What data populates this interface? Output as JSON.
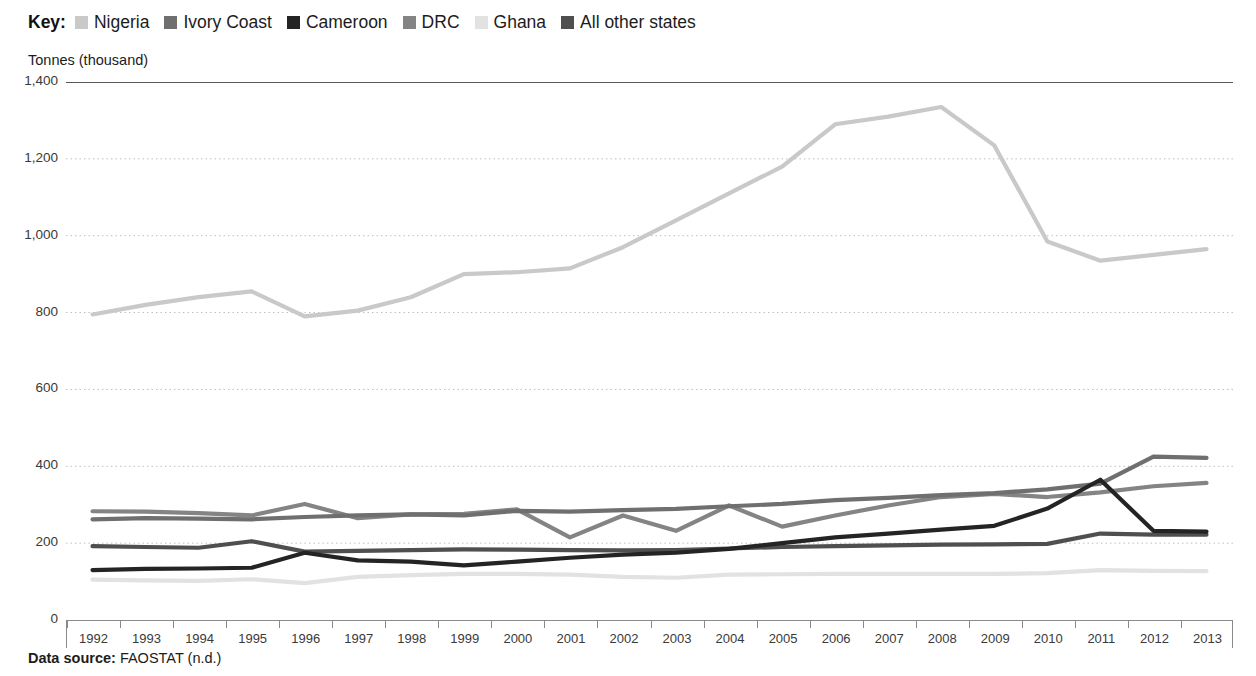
{
  "legend": {
    "key_label": "Key:",
    "items": [
      {
        "label": "Nigeria",
        "color": "#c9c9c9"
      },
      {
        "label": "Ivory Coast",
        "color": "#6f6f6f"
      },
      {
        "label": "Cameroon",
        "color": "#242424"
      },
      {
        "label": "DRC",
        "color": "#848484"
      },
      {
        "label": "Ghana",
        "color": "#e2e2e2"
      },
      {
        "label": "All other states",
        "color": "#4f4f4f"
      }
    ]
  },
  "source": {
    "prefix": "Data source:",
    "text": "FAOSTAT (n.d.)"
  },
  "chart_data": {
    "type": "line",
    "title": "",
    "xlabel": "",
    "ylabel": "Tonnes (thousand)",
    "ylim": [
      0,
      1400
    ],
    "ytick_labels": [
      "1,400",
      "1,200",
      "1,000",
      "800",
      "600",
      "400",
      "200",
      "0"
    ],
    "yticks": [
      1400,
      1200,
      1000,
      800,
      600,
      400,
      200,
      0
    ],
    "grid": "horizontal-dotted",
    "legend_position": "top",
    "categories": [
      1992,
      1993,
      1994,
      1995,
      1996,
      1997,
      1998,
      1999,
      2000,
      2001,
      2002,
      2003,
      2004,
      2005,
      2006,
      2007,
      2008,
      2009,
      2010,
      2011,
      2012,
      2013
    ],
    "x_tick_labels": [
      "1992",
      "1993",
      "1994",
      "1995",
      "1996",
      "1997",
      "1998",
      "1999",
      "2000",
      "2001",
      "2002",
      "2003",
      "2004",
      "2005",
      "2006",
      "2007",
      "2008",
      "2009",
      "2010",
      "2011",
      "2012",
      "2013"
    ],
    "series": [
      {
        "name": "Nigeria",
        "color": "#c9c9c9",
        "values": [
          795,
          820,
          840,
          855,
          790,
          805,
          840,
          900,
          905,
          915,
          970,
          1040,
          1110,
          1180,
          1290,
          1310,
          1335,
          1235,
          985,
          935,
          950,
          965
        ]
      },
      {
        "name": "Ivory Coast",
        "color": "#6f6f6f",
        "values": [
          262,
          265,
          264,
          262,
          268,
          272,
          275,
          272,
          284,
          282,
          286,
          289,
          296,
          302,
          312,
          318,
          325,
          330,
          340,
          355,
          425,
          422
        ]
      },
      {
        "name": "Cameroon",
        "color": "#242424",
        "values": [
          130,
          133,
          134,
          136,
          175,
          155,
          152,
          142,
          152,
          162,
          170,
          175,
          185,
          200,
          215,
          225,
          235,
          245,
          290,
          365,
          232,
          230
        ]
      },
      {
        "name": "DRC",
        "color": "#848484",
        "values": [
          283,
          282,
          278,
          272,
          302,
          265,
          275,
          276,
          288,
          215,
          272,
          232,
          298,
          243,
          272,
          298,
          320,
          328,
          320,
          332,
          348,
          357
        ]
      },
      {
        "name": "Ghana",
        "color": "#e2e2e2",
        "values": [
          105,
          103,
          102,
          106,
          96,
          112,
          117,
          120,
          120,
          118,
          112,
          110,
          118,
          119,
          120,
          120,
          120,
          120,
          122,
          130,
          128,
          127
        ]
      },
      {
        "name": "All other states",
        "color": "#4f4f4f",
        "values": [
          192,
          190,
          188,
          205,
          178,
          180,
          182,
          184,
          183,
          182,
          181,
          182,
          186,
          190,
          192,
          194,
          196,
          197,
          198,
          225,
          222,
          222
        ]
      }
    ]
  }
}
